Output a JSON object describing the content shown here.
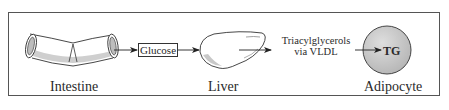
{
  "diagram": {
    "type": "metabolic-pathway",
    "nodes": [
      {
        "id": "intestine",
        "label": "Intestine",
        "shape": "tube"
      },
      {
        "id": "glucose",
        "label": "Glucose",
        "shape": "box"
      },
      {
        "id": "liver",
        "label": "Liver",
        "shape": "organ"
      },
      {
        "id": "triacylglycerols",
        "label_line1": "Triacylglycerols",
        "label_line2": "via VLDL",
        "shape": "text"
      },
      {
        "id": "adipocyte",
        "label": "Adipocyte",
        "inner_label": "TG",
        "shape": "circle"
      }
    ],
    "edges": [
      {
        "from": "intestine",
        "to": "glucose"
      },
      {
        "from": "glucose",
        "to": "liver"
      },
      {
        "from": "liver",
        "to": "triacylglycerols"
      },
      {
        "from": "triacylglycerols",
        "to": "adipocyte"
      }
    ],
    "colors": {
      "stroke": "#333333",
      "shading": "#c8c8c8",
      "adipocyte_fill": "#c9c9c9",
      "background": "#ffffff"
    }
  }
}
